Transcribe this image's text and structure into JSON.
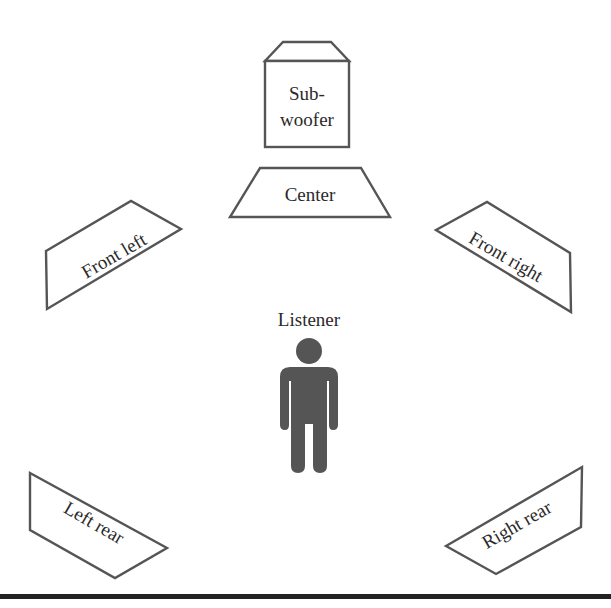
{
  "diagram": {
    "type": "surround-sound speaker layout",
    "speakers": {
      "subwoofer": {
        "line1": "Sub-",
        "line2": "woofer"
      },
      "center": {
        "label": "Center"
      },
      "front_left": {
        "label": "Front left"
      },
      "front_right": {
        "label": "Front right"
      },
      "left_rear": {
        "label": "Left rear"
      },
      "right_rear": {
        "label": "Right rear"
      }
    },
    "listener": {
      "label": "Listener",
      "icon": "person-icon"
    },
    "colors": {
      "outline": "#555555",
      "figure": "#555555",
      "text": "#2a2a2a",
      "rule": "#222222"
    }
  }
}
